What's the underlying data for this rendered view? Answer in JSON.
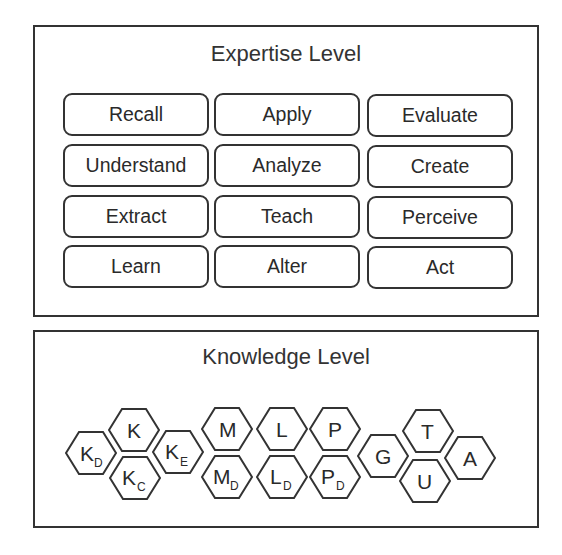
{
  "expertise": {
    "title": "Expertise Level",
    "items": [
      [
        "Recall",
        "Apply",
        "Evaluate"
      ],
      [
        "Understand",
        "Analyze",
        "Create"
      ],
      [
        "Extract",
        "Teach",
        "Perceive"
      ],
      [
        "Learn",
        "Alter",
        "Act"
      ]
    ]
  },
  "knowledge": {
    "title": "Knowledge Level",
    "hexagons": [
      {
        "id": "K_D",
        "label": "K",
        "sub": "D"
      },
      {
        "id": "K",
        "label": "K",
        "sub": ""
      },
      {
        "id": "K_C",
        "label": "K",
        "sub": "C"
      },
      {
        "id": "K_E",
        "label": "K",
        "sub": "E"
      },
      {
        "id": "M",
        "label": "M",
        "sub": ""
      },
      {
        "id": "M_D",
        "label": "M",
        "sub": "D"
      },
      {
        "id": "L",
        "label": "L",
        "sub": ""
      },
      {
        "id": "L_D",
        "label": "L",
        "sub": "D"
      },
      {
        "id": "P",
        "label": "P",
        "sub": ""
      },
      {
        "id": "P_D",
        "label": "P",
        "sub": "D"
      },
      {
        "id": "G",
        "label": "G",
        "sub": ""
      },
      {
        "id": "T",
        "label": "T",
        "sub": ""
      },
      {
        "id": "U",
        "label": "U",
        "sub": ""
      },
      {
        "id": "A",
        "label": "A",
        "sub": ""
      }
    ]
  }
}
